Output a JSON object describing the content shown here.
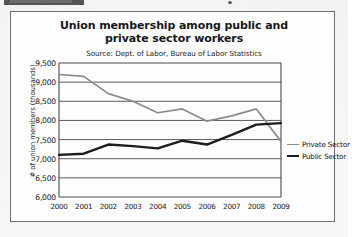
{
  "chart_data": {
    "type": "line",
    "title": "Union membership among public and private sector workers",
    "subtitle": "Source: Dept. of Labor, Bureau of Labor Statistics",
    "xlabel": "",
    "ylabel": "# of union members (thousands)",
    "categories": [
      "2000",
      "2001",
      "2002",
      "2003",
      "2004",
      "2005",
      "2006",
      "2007",
      "2008",
      "2009"
    ],
    "yticks": [
      "6,000",
      "6,500",
      "7,000",
      "7,500",
      "8,000",
      "8,500",
      "9,000",
      "9,500"
    ],
    "ylim": [
      6000,
      9500
    ],
    "grid": true,
    "legend_position": "right",
    "series": [
      {
        "name": "Private Sector",
        "color": "#8a8a8a",
        "width": 1.7,
        "values": [
          9200,
          9150,
          8700,
          8500,
          8200,
          8300,
          7980,
          8120,
          8300,
          7450
        ]
      },
      {
        "name": "Public Sector",
        "color": "#1c1c1c",
        "width": 2.4,
        "values": [
          7100,
          7130,
          7370,
          7330,
          7270,
          7470,
          7370,
          7620,
          7890,
          7930
        ]
      }
    ]
  },
  "legend": {
    "items": [
      {
        "label": "Private Sector"
      },
      {
        "label": "Public Sector"
      }
    ]
  }
}
